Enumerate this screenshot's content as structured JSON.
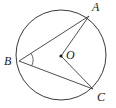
{
  "figure": {
    "name": "circle-with-inscribed-angle",
    "canvas": {
      "width": 116,
      "height": 108
    },
    "colors": {
      "stroke": "#3a3a3a",
      "label": "#1a1a1a",
      "background": "#ffffff"
    },
    "circle": {
      "center_label": "O",
      "cx": 61,
      "cy": 55,
      "r": 45,
      "stroke_width": 1
    },
    "center_dot": {
      "cx": 61,
      "cy": 56,
      "r": 1.6
    },
    "points": [
      {
        "label": "A",
        "x": 89,
        "y": 16,
        "label_x": 94,
        "label_y": 1
      },
      {
        "label": "B",
        "x": 19,
        "y": 61,
        "label_x": 4,
        "label_y": 56
      },
      {
        "label": "C",
        "x": 93,
        "y": 89,
        "label_x": 98,
        "label_y": 92
      }
    ],
    "center": {
      "label": "O",
      "x": 61,
      "y": 56,
      "label_x": 66,
      "label_y": 49
    },
    "segments": [
      {
        "name": "chord-BA",
        "from": "B",
        "to": "A",
        "x1": 19,
        "y1": 61,
        "x2": 89,
        "y2": 16
      },
      {
        "name": "chord-BC",
        "from": "B",
        "to": "C",
        "x1": 19,
        "y1": 61,
        "x2": 93,
        "y2": 89
      },
      {
        "name": "radius-OA",
        "from": "O",
        "to": "A",
        "x1": 61,
        "y1": 56,
        "x2": 89,
        "y2": 16
      },
      {
        "name": "radius-OC",
        "from": "O",
        "to": "C",
        "x1": 61,
        "y1": 56,
        "x2": 93,
        "y2": 89
      }
    ],
    "angle_arc": {
      "name": "angle-arc-at-B",
      "vertex": "B",
      "path": "M 31.2 53.5 A 13 13 0 0 1 31.7 65.9"
    }
  }
}
